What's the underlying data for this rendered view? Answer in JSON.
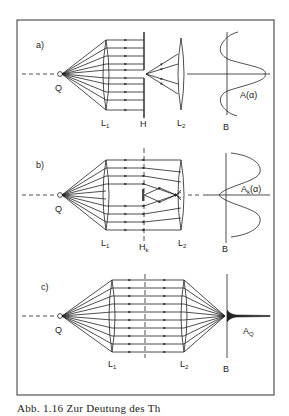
{
  "figure": {
    "frame": {
      "x": 17,
      "y": 20,
      "width": 257,
      "height": 375,
      "stroke": "#333333"
    },
    "ink_color": "#222222",
    "panels": [
      {
        "id": "a",
        "label": "a)",
        "source_label": "Q",
        "lens1_label": "L",
        "lens1_sub": "1",
        "aperture_label": "H",
        "lens2_label": "L",
        "lens2_sub": "2",
        "screen_label": "B",
        "amplitude_label": "A(α)"
      },
      {
        "id": "b",
        "label": "b)",
        "source_label": "Q",
        "lens1_label": "L",
        "lens1_sub": "1",
        "aperture_label": "H",
        "aperture_sub": "k",
        "lens2_label": "L",
        "lens2_sub": "2",
        "screen_label": "B",
        "amplitude_label": "A",
        "amplitude_sub": "k",
        "amplitude_arg": "(α)"
      },
      {
        "id": "c",
        "label": "c)",
        "source_label": "Q",
        "lens1_label": "L",
        "lens1_sub": "1",
        "lens2_label": "L",
        "lens2_sub": "2",
        "screen_label": "B",
        "amplitude_label": "A",
        "amplitude_sub": "Q"
      }
    ]
  },
  "caption": "Abb. 1.16 Zur Deutung des Th"
}
